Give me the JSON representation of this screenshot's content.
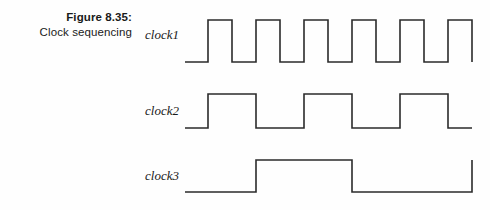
{
  "caption": {
    "figure_number": "Figure 8.35:",
    "title": "Clock sequencing"
  },
  "signals": [
    {
      "label": "clock1"
    },
    {
      "label": "clock2"
    },
    {
      "label": "clock3"
    }
  ],
  "colors": {
    "background": "#fefefe",
    "waveform_stroke": "#2b2b2b",
    "text": "#1a1a1a"
  },
  "chart_data": {
    "type": "line",
    "title": "Clock sequencing",
    "xlabel": "",
    "ylabel": "",
    "grid": false,
    "legend": "none",
    "x_start": 185,
    "x_end": 472,
    "series": [
      {
        "name": "clock1",
        "low_y": 62,
        "high_y": 20,
        "period_px": 47.8,
        "duty_cycle": 0.5,
        "pulse_count": 6,
        "initial_level": "low",
        "initial_low_width_px": 23,
        "transitions_x": [
          208,
          232,
          256,
          280,
          304,
          328,
          352,
          376,
          400,
          424,
          448,
          472
        ],
        "points": [
          [
            185,
            62
          ],
          [
            208,
            62
          ],
          [
            208,
            20
          ],
          [
            232,
            20
          ],
          [
            232,
            62
          ],
          [
            256,
            62
          ],
          [
            256,
            20
          ],
          [
            280,
            20
          ],
          [
            280,
            62
          ],
          [
            304,
            62
          ],
          [
            304,
            20
          ],
          [
            328,
            20
          ],
          [
            328,
            62
          ],
          [
            352,
            62
          ],
          [
            352,
            20
          ],
          [
            376,
            20
          ],
          [
            376,
            62
          ],
          [
            400,
            62
          ],
          [
            400,
            20
          ],
          [
            424,
            20
          ],
          [
            424,
            62
          ],
          [
            448,
            62
          ],
          [
            448,
            20
          ],
          [
            472,
            20
          ],
          [
            472,
            62
          ]
        ]
      },
      {
        "name": "clock2",
        "low_y": 128,
        "high_y": 94,
        "period_px": 95.6,
        "duty_cycle": 0.5,
        "pulse_count": 3,
        "initial_level": "low",
        "initial_low_width_px": 23,
        "transitions_x": [
          208,
          256,
          304,
          352,
          400,
          448,
          472
        ],
        "points": [
          [
            185,
            128
          ],
          [
            208,
            128
          ],
          [
            208,
            94
          ],
          [
            256,
            94
          ],
          [
            256,
            128
          ],
          [
            304,
            128
          ],
          [
            304,
            94
          ],
          [
            352,
            94
          ],
          [
            352,
            128
          ],
          [
            400,
            128
          ],
          [
            400,
            94
          ],
          [
            448,
            94
          ],
          [
            448,
            128
          ],
          [
            472,
            128
          ]
        ]
      },
      {
        "name": "clock3",
        "low_y": 192,
        "high_y": 160,
        "period_px": 191.2,
        "duty_cycle": 0.5,
        "pulse_count": 1,
        "initial_level": "low",
        "initial_low_width_px": 71,
        "transitions_x": [
          256,
          352,
          472
        ],
        "points": [
          [
            185,
            192
          ],
          [
            256,
            192
          ],
          [
            256,
            160
          ],
          [
            352,
            160
          ],
          [
            352,
            192
          ],
          [
            472,
            192
          ],
          [
            472,
            160
          ]
        ]
      }
    ]
  }
}
